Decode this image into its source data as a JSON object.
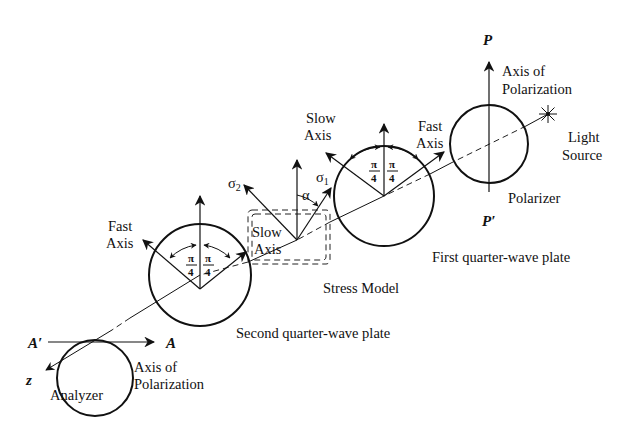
{
  "diagram": {
    "components": {
      "light_source": {
        "label_line1": "Light",
        "label_line2": "Source"
      },
      "polarizer": {
        "label": "Polarizer",
        "axis_label_line1": "Axis of",
        "axis_label_line2": "Polarization",
        "axis_top": "P",
        "axis_bottom": "P′"
      },
      "first_quarter_wave_plate": {
        "label": "First quarter-wave plate",
        "slow_axis_line1": "Slow",
        "slow_axis_line2": "Axis",
        "fast_axis_line1": "Fast",
        "fast_axis_line2": "Axis",
        "angle_num": "π",
        "angle_den": "4"
      },
      "stress_model": {
        "label": "Stress Model",
        "sigma_2": "σ",
        "sigma_2_sub": "2",
        "sigma_1": "σ",
        "sigma_1_sub": "1",
        "alpha": "α",
        "slow_axis_line1": "Slow",
        "slow_axis_line2": "Axis"
      },
      "second_quarter_wave_plate": {
        "label": "Second quarter-wave plate",
        "fast_axis_line1": "Fast",
        "fast_axis_line2": "Axis",
        "angle_num": "π",
        "angle_den": "4"
      },
      "analyzer": {
        "label": "Analyzer",
        "axis_label_line1": "Axis of",
        "axis_label_line2": "Polarization",
        "axis_left": "A′",
        "axis_right": "A",
        "z_label": "z"
      }
    }
  }
}
